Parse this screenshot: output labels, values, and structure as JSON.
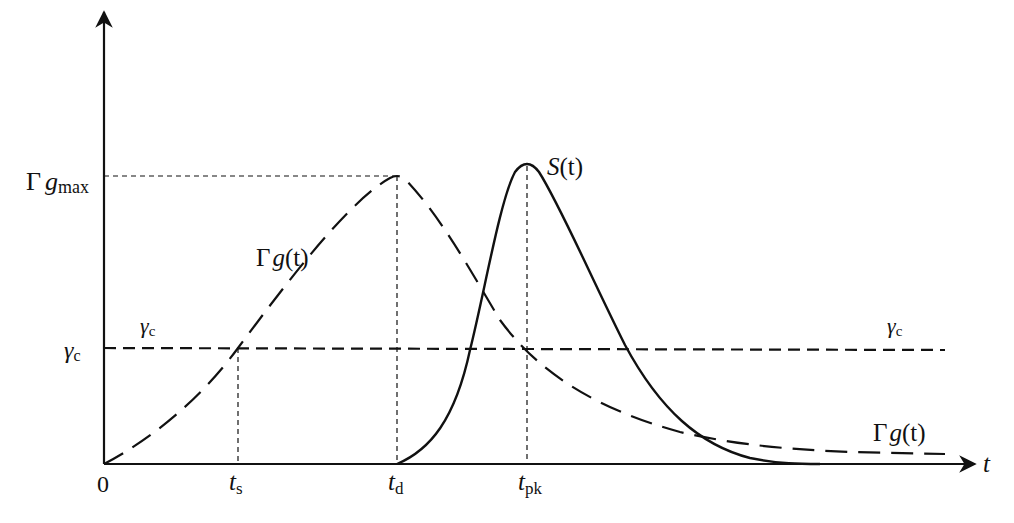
{
  "diagram": {
    "axes": {
      "x_label": "t",
      "origin_label": "0",
      "y_labels": {
        "gmax": {
          "greek": "Γ",
          "var": "g",
          "sub": "max"
        },
        "gamma_c": {
          "var": "γ",
          "sub": "c"
        }
      },
      "x_ticks": [
        {
          "id": "ts",
          "var": "t",
          "sub": "s"
        },
        {
          "id": "td",
          "var": "t",
          "sub": "d"
        },
        {
          "id": "tpk",
          "var": "t",
          "sub": "pk"
        }
      ]
    },
    "curves": {
      "gain": {
        "greek": "Γ",
        "var": "g",
        "arg": "(t)",
        "style": "long-dash"
      },
      "photon": {
        "var": "S",
        "arg": "(t)",
        "style": "solid"
      },
      "threshold": {
        "var": "γ",
        "sub": "c",
        "style": "short-dash"
      }
    },
    "colors": {
      "ink": "#111111",
      "background": "#ffffff"
    }
  }
}
